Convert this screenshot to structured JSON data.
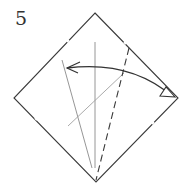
{
  "diagram": {
    "step_number": "5",
    "colors": {
      "edge": "#3a3a3a",
      "crease": "#8a8a8a",
      "arrow": "#333333",
      "background": "#ffffff"
    },
    "square": {
      "top": [
        95,
        13
      ],
      "right": [
        178,
        98
      ],
      "bottom": [
        96,
        182
      ],
      "left": [
        14,
        98
      ]
    },
    "creases": [
      {
        "name": "vertical-crease",
        "from": [
          95,
          42
        ],
        "to": [
          95,
          168
        ]
      },
      {
        "name": "left-slant-crease",
        "from": [
          62,
          60
        ],
        "to": [
          92,
          168
        ]
      },
      {
        "name": "diagonal-crease",
        "from": [
          68,
          126
        ],
        "to": [
          124,
          73
        ]
      }
    ],
    "valley_fold_line": {
      "from": [
        129,
        48
      ],
      "to": [
        96,
        180
      ]
    },
    "fold_arrow": {
      "from": [
        176,
        97
      ],
      "to": [
        67,
        68
      ],
      "type": "two-way"
    }
  }
}
